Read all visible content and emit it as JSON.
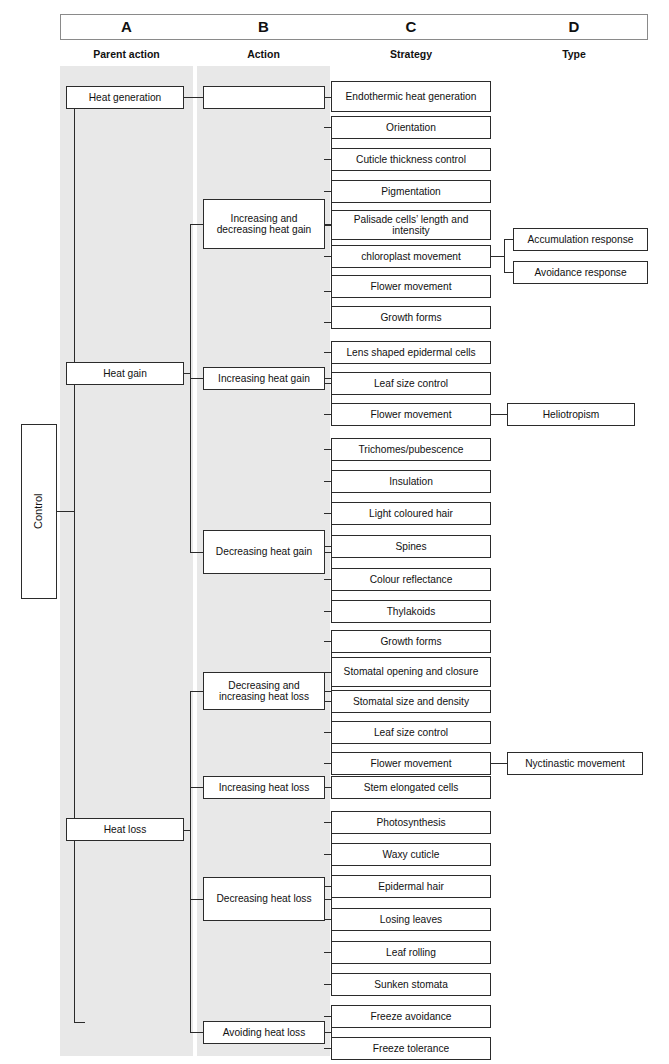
{
  "header": {
    "columns": [
      {
        "letter": "A",
        "label": "Parent action"
      },
      {
        "letter": "B",
        "label": "Action"
      },
      {
        "letter": "C",
        "label": "Strategy"
      },
      {
        "letter": "D",
        "label": "Type"
      }
    ]
  },
  "root": {
    "label": "Control"
  },
  "parent_actions": [
    {
      "label": "Heat generation"
    },
    {
      "label": "Heat gain"
    },
    {
      "label": "Heat loss"
    }
  ],
  "actions": [
    {
      "label": ""
    },
    {
      "label": "Increasing and decreasing heat gain"
    },
    {
      "label": "Increasing heat gain"
    },
    {
      "label": "Decreasing heat gain"
    },
    {
      "label": "Decreasing and increasing heat loss"
    },
    {
      "label": "Increasing heat loss"
    },
    {
      "label": "Decreasing heat loss"
    },
    {
      "label": "Avoiding heat loss"
    }
  ],
  "strategies": [
    {
      "label": "Endothermic heat generation"
    },
    {
      "label": "Orientation"
    },
    {
      "label": "Cuticle thickness control"
    },
    {
      "label": "Pigmentation"
    },
    {
      "label": "Palisade cells’ length and intensity"
    },
    {
      "label": "chloroplast movement"
    },
    {
      "label": "Flower movement"
    },
    {
      "label": "Growth forms"
    },
    {
      "label": "Lens shaped epidermal cells"
    },
    {
      "label": "Leaf size control"
    },
    {
      "label": "Flower movement"
    },
    {
      "label": "Trichomes/pubescence"
    },
    {
      "label": "Insulation"
    },
    {
      "label": "Light coloured hair"
    },
    {
      "label": "Spines"
    },
    {
      "label": "Colour reflectance"
    },
    {
      "label": "Thylakoids"
    },
    {
      "label": "Growth forms"
    },
    {
      "label": "Stomatal opening and closure"
    },
    {
      "label": "Stomatal size and density"
    },
    {
      "label": "Leaf size control"
    },
    {
      "label": "Flower movement"
    },
    {
      "label": "Stem elongated cells"
    },
    {
      "label": "Photosynthesis"
    },
    {
      "label": "Waxy cuticle"
    },
    {
      "label": "Epidermal hair"
    },
    {
      "label": "Losing leaves"
    },
    {
      "label": "Leaf rolling"
    },
    {
      "label": "Sunken stomata"
    },
    {
      "label": "Freeze avoidance"
    },
    {
      "label": "Freeze tolerance"
    }
  ],
  "types": [
    {
      "label": "Accumulation response"
    },
    {
      "label": "Avoidance response"
    },
    {
      "label": "Heliotropism"
    },
    {
      "label": "Nyctinastic movement"
    }
  ],
  "colors": {
    "band": "#e8e8e8",
    "box_border": "#2b2b2b",
    "header_border": "#8a8a8a",
    "text": "#111111",
    "page_background": "#ffffff"
  }
}
